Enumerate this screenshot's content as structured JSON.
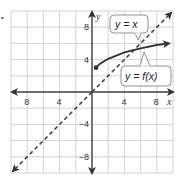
{
  "figure": {
    "bullet": "•",
    "x_axis": {
      "label": "x",
      "ticks": [
        {
          "value": -8,
          "text": "8"
        },
        {
          "value": -4,
          "text": "4"
        },
        {
          "value": 4,
          "text": "4"
        },
        {
          "value": 8,
          "text": "8"
        }
      ]
    },
    "y_axis": {
      "label": "y",
      "ticks": [
        {
          "value": 8,
          "text": "8"
        },
        {
          "value": 4,
          "text": "4"
        },
        {
          "value": -4,
          "text": "−4"
        },
        {
          "value": -8,
          "text": "−8"
        }
      ]
    },
    "callouts": {
      "identity": "y = x",
      "function": "y = f(x)"
    },
    "colors": {
      "grid": "#c8c8c8",
      "axis": "#444444",
      "curve": "#333333",
      "dashed": "#444444"
    }
  },
  "chart_data": {
    "type": "line",
    "title": "",
    "xlabel": "x",
    "ylabel": "y",
    "xlim": [
      -10,
      10
    ],
    "ylim": [
      -10,
      10
    ],
    "grid": true,
    "grid_step": 2,
    "series": [
      {
        "name": "y = x",
        "style": "dashed",
        "x": [
          -9.5,
          9.5
        ],
        "y": [
          -9.5,
          9.5
        ]
      },
      {
        "name": "y = f(x)",
        "style": "solid",
        "start_point": [
          0.5,
          3
        ],
        "closed_endpoint": true,
        "x": [
          0.5,
          1,
          2,
          4,
          6,
          8,
          9.5
        ],
        "y": [
          3,
          3.5,
          4.1,
          4.9,
          5.4,
          5.8,
          6.0
        ]
      }
    ]
  }
}
